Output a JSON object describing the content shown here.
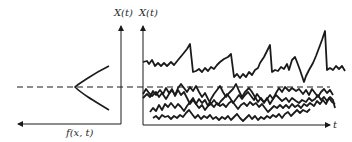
{
  "diagram": {
    "labels": {
      "left_axis_label": "X(t)",
      "right_axis_label": "X(t)",
      "density_axis_label": "f(x, t)",
      "time_axis_label": "t"
    },
    "colors": {
      "ink": "#1a1a1a",
      "background": "#ffffff"
    },
    "density_curve": {
      "shape": "bell",
      "orientation": "horizontal, opening left",
      "peak_at": "mean level (dashed line)"
    },
    "sample_paths": {
      "count": 4,
      "mean_level": "dashed line",
      "upper_path": "spiky trace above mean",
      "lower_paths": 3
    }
  }
}
